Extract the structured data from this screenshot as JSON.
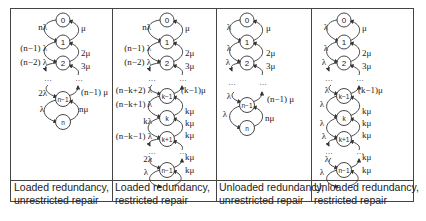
{
  "figure": {
    "columns": [
      {
        "caption_line1": "Loaded redundancy,",
        "caption_line2": "unrestricted repair",
        "states": [
          "0",
          "1",
          "2",
          "n−1",
          "n"
        ],
        "left_rates": [
          "nλ",
          "(n−1) λ",
          "(n−2) λ",
          "2λ",
          "λ"
        ],
        "right_rates": [
          "μ",
          "2μ",
          "3μ",
          "(n−1) μ",
          "nμ"
        ],
        "ellipsis": "…"
      },
      {
        "caption_line1": "Loaded redundancy,",
        "caption_line2": "restricted repair",
        "states": [
          "0",
          "1",
          "2",
          "k−1",
          "k",
          "k+1",
          "n−1",
          "n"
        ],
        "left_rates": [
          "nλ",
          "(n−1) λ",
          "(n−2) λ",
          "(n−k+2) λ",
          "(n−k+1) λ",
          "kλ",
          "(n−k−1) λ",
          "2λ",
          "λ"
        ],
        "right_rates": [
          "μ",
          "2μ",
          "3μ",
          "(k−1)μ",
          "kμ",
          "kμ",
          "kμ",
          "kμ",
          "kμ"
        ],
        "ellipsis": "…"
      },
      {
        "caption_line1": "Unloaded redundancy,",
        "caption_line2": "unrestricted repair",
        "states": [
          "0",
          "1",
          "2",
          "n−1",
          "n"
        ],
        "left_rates": [
          "λ",
          "λ",
          "λ",
          "λ",
          "λ"
        ],
        "right_rates": [
          "μ",
          "2μ",
          "3μ",
          "(n−1) μ",
          "nμ"
        ],
        "ellipsis": "…"
      },
      {
        "caption_line1": "Unloaded redundancy,",
        "caption_line2": "restricted repair",
        "states": [
          "0",
          "1",
          "2",
          "k−1",
          "k",
          "k+1",
          "n−1",
          "n"
        ],
        "left_rates": [
          "λ",
          "λ",
          "λ",
          "λ",
          "λ",
          "λ",
          "λ",
          "λ",
          "λ"
        ],
        "right_rates": [
          "μ",
          "2μ",
          "3μ",
          "(k−1)μ",
          "kμ",
          "kμ",
          "kμ",
          "kμ",
          "kμ"
        ],
        "ellipsis": "…"
      }
    ]
  }
}
